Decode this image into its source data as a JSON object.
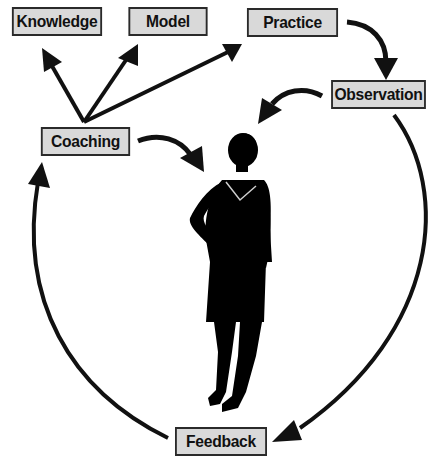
{
  "diagram": {
    "type": "coaching-cycle",
    "colors": {
      "box_fill": "#d9d9d9",
      "box_border": "#2a2a2a",
      "arrow": "#111111",
      "silhouette": "#000000"
    },
    "nodes": [
      {
        "id": "knowledge",
        "label": "Knowledge"
      },
      {
        "id": "model",
        "label": "Model"
      },
      {
        "id": "practice",
        "label": "Practice"
      },
      {
        "id": "observation",
        "label": "Observation"
      },
      {
        "id": "coaching",
        "label": "Coaching"
      },
      {
        "id": "feedback",
        "label": "Feedback"
      }
    ],
    "edges": [
      {
        "from": "coaching",
        "to": "knowledge"
      },
      {
        "from": "coaching",
        "to": "model"
      },
      {
        "from": "coaching",
        "to": "practice"
      },
      {
        "from": "practice",
        "to": "observation"
      },
      {
        "from": "observation",
        "to": "person"
      },
      {
        "from": "coaching",
        "to": "person"
      },
      {
        "from": "observation",
        "to": "feedback"
      },
      {
        "from": "feedback",
        "to": "coaching"
      }
    ],
    "center_figure": "woman-silhouette"
  }
}
